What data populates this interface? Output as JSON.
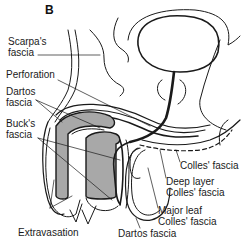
{
  "figure": {
    "panel_letter": "B",
    "labels": {
      "scarpas_fascia": [
        "Scarpa's",
        "fascia"
      ],
      "perforation": "Perforation",
      "dartos_fascia_top": [
        "Dartos",
        "fascia"
      ],
      "bucks_fascia": [
        "Buck's",
        "fascia"
      ],
      "extravasation": "Extravasation",
      "dartos_fascia_bottom": "Dartos fascia",
      "colles_fascia": "Colles' fascia",
      "deep_layer_colles": [
        "Deep layer",
        "Colles' fascia"
      ],
      "major_leaf_colles": [
        "Major leaf",
        "Colles' fascia"
      ]
    },
    "colors": {
      "line": "#1a1a1a",
      "shading": "#a8a8a8",
      "background": "#ffffff"
    }
  }
}
